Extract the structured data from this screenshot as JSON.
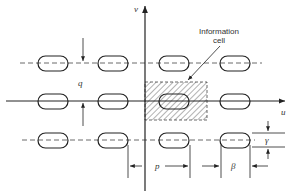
{
  "diagram": {
    "axes": {
      "horizontal": "u",
      "vertical": "v"
    },
    "annotation": {
      "line1": "Information",
      "line2": "cell"
    },
    "dimensions": {
      "q": "q",
      "p": "p",
      "beta": "β",
      "gamma": "γ"
    },
    "grid": {
      "rows": 3,
      "columns": 4
    },
    "colors": {
      "stroke": "#222222",
      "hatch": "#555555",
      "background": "#ffffff"
    }
  }
}
